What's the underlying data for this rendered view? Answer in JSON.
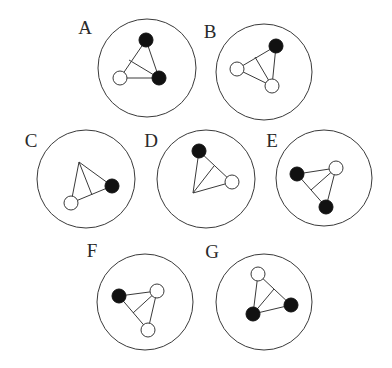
{
  "figure": {
    "width": 392,
    "height": 368,
    "colors": {
      "line": "#3a3a3a",
      "filled_node": "#111111",
      "open_node": "#ffffff",
      "background": "#ffffff"
    },
    "node_radius": 7,
    "panels": [
      {
        "label": "A",
        "label_pos": [
          85,
          34
        ],
        "circle": {
          "cx": 147,
          "cy": 68,
          "r": 49
        },
        "vertices": [
          {
            "x": 146,
            "y": 40,
            "type": "filled"
          },
          {
            "x": 159,
            "y": 78,
            "type": "filled"
          },
          {
            "x": 120,
            "y": 78,
            "type": "open"
          }
        ],
        "inner_line": {
          "x1": 159,
          "y1": 78,
          "x2": 129,
          "y2": 60
        }
      },
      {
        "label": "B",
        "label_pos": [
          210,
          38
        ],
        "circle": {
          "cx": 264,
          "cy": 72,
          "r": 48
        },
        "vertices": [
          {
            "x": 276,
            "y": 46,
            "type": "filled"
          },
          {
            "x": 237,
            "y": 69,
            "type": "open"
          },
          {
            "x": 272,
            "y": 86,
            "type": "open"
          }
        ],
        "inner_line": {
          "x1": 272,
          "y1": 86,
          "x2": 255,
          "y2": 57
        }
      },
      {
        "label": "C",
        "label_pos": [
          31,
          147
        ],
        "circle": {
          "cx": 86,
          "cy": 179,
          "r": 49
        },
        "vertices": [
          {
            "x": 79,
            "y": 162,
            "type": "bare"
          },
          {
            "x": 112,
            "y": 186,
            "type": "filled"
          },
          {
            "x": 71,
            "y": 203,
            "type": "open"
          }
        ],
        "inner_line": {
          "x1": 79,
          "y1": 162,
          "x2": 92,
          "y2": 195
        }
      },
      {
        "label": "D",
        "label_pos": [
          151,
          147
        ],
        "circle": {
          "cx": 206,
          "cy": 179,
          "r": 49
        },
        "vertices": [
          {
            "x": 199,
            "y": 151,
            "type": "filled"
          },
          {
            "x": 232,
            "y": 182,
            "type": "open"
          },
          {
            "x": 193,
            "y": 193,
            "type": "bare"
          }
        ],
        "inner_line": {
          "x1": 193,
          "y1": 193,
          "x2": 214,
          "y2": 166
        }
      },
      {
        "label": "E",
        "label_pos": [
          272,
          147
        ],
        "circle": {
          "cx": 324,
          "cy": 178,
          "r": 48
        },
        "vertices": [
          {
            "x": 336,
            "y": 168,
            "type": "open"
          },
          {
            "x": 297,
            "y": 174,
            "type": "filled"
          },
          {
            "x": 326,
            "y": 207,
            "type": "filled"
          }
        ],
        "inner_line": {
          "x1": 336,
          "y1": 168,
          "x2": 311,
          "y2": 190
        }
      },
      {
        "label": "F",
        "label_pos": [
          92,
          257
        ],
        "circle": {
          "cx": 145,
          "cy": 302,
          "r": 48
        },
        "vertices": [
          {
            "x": 119,
            "y": 296,
            "type": "filled"
          },
          {
            "x": 157,
            "y": 291,
            "type": "open"
          },
          {
            "x": 148,
            "y": 330,
            "type": "open"
          }
        ],
        "inner_line": {
          "x1": 157,
          "y1": 291,
          "x2": 133,
          "y2": 313
        }
      },
      {
        "label": "G",
        "label_pos": [
          212,
          258
        ],
        "circle": {
          "cx": 264,
          "cy": 302,
          "r": 48
        },
        "vertices": [
          {
            "x": 258,
            "y": 274,
            "type": "open"
          },
          {
            "x": 291,
            "y": 305,
            "type": "filled"
          },
          {
            "x": 253,
            "y": 314,
            "type": "filled"
          }
        ],
        "inner_line": {
          "x1": 253,
          "y1": 314,
          "x2": 274,
          "y2": 289
        }
      }
    ]
  }
}
